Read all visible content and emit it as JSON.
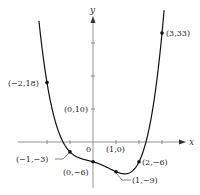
{
  "chart_data": {
    "type": "line",
    "title": "",
    "function": "x^4 - x^3 - x^2 - 2x - 6",
    "xlabel": "x",
    "ylabel": "y",
    "xlim": [
      -3.2,
      3.8
    ],
    "ylim": [
      -13,
      43
    ],
    "grid": false,
    "legend": null,
    "x_ticks": [
      -2,
      -1,
      1,
      2,
      3
    ],
    "y_ticks": [
      -6,
      10,
      20,
      30
    ],
    "origin_label": "0",
    "points": [
      {
        "x": -2,
        "y": 18,
        "label": "(−2,18)"
      },
      {
        "x": -1,
        "y": -3,
        "label": "(−1,−3)"
      },
      {
        "x": 0,
        "y": -6,
        "label": "(0,−6)"
      },
      {
        "x": 1,
        "y": -9,
        "label": "(1,−9)"
      },
      {
        "x": 2,
        "y": -6,
        "label": "(2,−6)"
      },
      {
        "x": 3,
        "y": 33,
        "label": "(3,33)"
      }
    ],
    "annotations": [
      {
        "x": 0,
        "y": 10,
        "label": "(0,10)"
      },
      {
        "x": 1,
        "y": 0,
        "label": "(1,0)"
      }
    ]
  }
}
